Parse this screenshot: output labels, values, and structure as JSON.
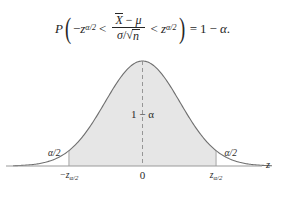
{
  "figure": {
    "title_formula_plain": "P(-z_{alpha/2} < (Xbar - mu)/(sigma/sqrt(n)) < z_{alpha/2}) = 1 - alpha.",
    "formula": {
      "p_symbol": "P",
      "open_paren": "(",
      "close_paren": ")",
      "minus_sign": "−",
      "left_bound_base": "z",
      "left_bound_sub": "α/2",
      "less_than_1": "<",
      "numerator_var": "X",
      "numerator_minus": "−",
      "numerator_mu": "μ",
      "denominator_sigma": "σ",
      "denominator_slash": "/",
      "radical_sign": "√",
      "radical_body": "n",
      "less_than_2": "<",
      "right_bound_base": "z",
      "right_bound_sub": "α/2",
      "equals": "=",
      "one": "1",
      "rhs_minus": "−",
      "alpha": "α",
      "period": "."
    }
  },
  "chart_data": {
    "type": "area",
    "title": "",
    "xlabel": "z",
    "ylabel": "",
    "distribution": "standard normal density",
    "xlim": [
      -3.45,
      3.45
    ],
    "ylim": [
      0,
      0.42
    ],
    "grid": false,
    "legend": null,
    "x": [
      -3.45,
      -3.2,
      -3.0,
      -2.75,
      -2.5,
      -2.25,
      -2.0,
      -1.96,
      -1.75,
      -1.5,
      -1.25,
      -1.0,
      -0.75,
      -0.5,
      -0.25,
      0.0,
      0.25,
      0.5,
      0.75,
      1.0,
      1.25,
      1.5,
      1.75,
      1.96,
      2.0,
      2.25,
      2.5,
      2.75,
      3.0,
      3.2,
      3.45
    ],
    "y": [
      0.001,
      0.002,
      0.004,
      0.009,
      0.018,
      0.032,
      0.054,
      0.058,
      0.086,
      0.13,
      0.183,
      0.242,
      0.301,
      0.352,
      0.387,
      0.399,
      0.387,
      0.352,
      0.301,
      0.242,
      0.183,
      0.13,
      0.086,
      0.058,
      0.054,
      0.032,
      0.018,
      0.009,
      0.004,
      0.002,
      0.001
    ],
    "shaded_region": {
      "from": -1.96,
      "to": 1.96,
      "fill_color": "#e6e6e6",
      "label": "1 − α"
    },
    "tail_labels": [
      {
        "text": "α/2",
        "side": "left",
        "at": -2.35
      },
      {
        "text": "α/2",
        "side": "right",
        "at": 2.35
      }
    ],
    "tick_labels": [
      {
        "text": "−z",
        "sub": "α/2",
        "value": -1.96
      },
      {
        "text": "0",
        "sub": "",
        "value": 0
      },
      {
        "text": "z",
        "sub": "α/2",
        "value": 1.96
      }
    ],
    "center_line": {
      "at": 0,
      "style": "dashed",
      "color": "#8c8c8c"
    },
    "curve_color": "#6f6f6f",
    "axis_color": "#9a9a9a",
    "background_color": "#ffffff"
  },
  "labels": {
    "center_area": "1 − α",
    "left_tail": "α/2",
    "right_tail": "α/2",
    "tick_left_base": "−z",
    "tick_left_sub": "α/2",
    "tick_center": "0",
    "tick_right_base": "z",
    "tick_right_sub": "α/2",
    "axis_label": "z"
  }
}
